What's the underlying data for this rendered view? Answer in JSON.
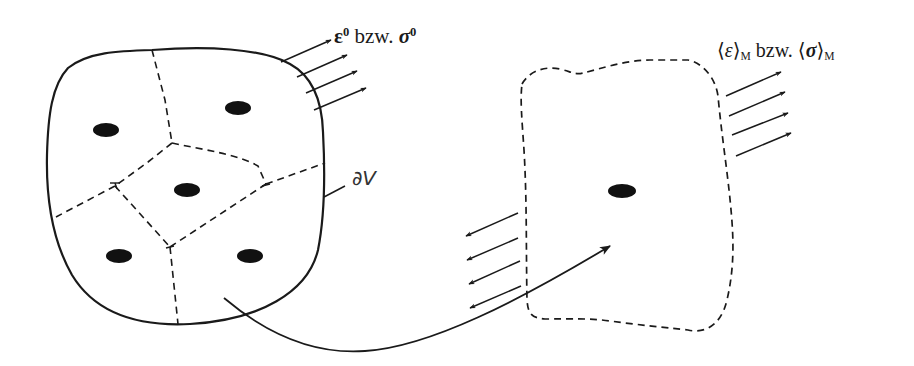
{
  "figure": {
    "colors": {
      "stroke": "#1a1a1a",
      "particle": "#111111",
      "background": "#ffffff",
      "bleed_through_text": "#eeeeee"
    },
    "left_volume": {
      "boundary_style": "solid",
      "boundary_label": "∂V",
      "particle_count": 5,
      "applied_load_label": {
        "strain": "ε",
        "strain_sup": "0",
        "connector": " bzw. ",
        "stress": "σ",
        "stress_sup": "0"
      },
      "arrow_count": 4,
      "arrow_direction": "outward"
    },
    "right_volume": {
      "boundary_style": "dashed",
      "particle_count": 1,
      "averaged_label": {
        "strain_open": "⟨",
        "strain": "ε",
        "strain_close": "⟩",
        "strain_sub": "M",
        "connector": " bzw. ",
        "stress_open": "⟨",
        "stress": "σ",
        "stress_close": "⟩",
        "stress_sub": "M"
      },
      "outward_arrow_count": 4,
      "inward_arrow_count": 4
    },
    "connector_arrow": {
      "from": "left_volume",
      "to": "right_volume",
      "style": "curved-solid-arrow"
    }
  }
}
